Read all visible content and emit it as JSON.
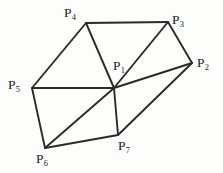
{
  "figure": {
    "kind": "planar-triangulated-point-mesh",
    "width": 223,
    "height": 173,
    "background_color": "#fdfdfc",
    "edge_color": "#2b2b2b",
    "edge_width": 1.9,
    "label_color": "#1c1c1c"
  },
  "vertices": [
    {
      "id": "P1",
      "base": "P",
      "index": "1",
      "x": 114,
      "y": 88,
      "label_x": 113,
      "label_y": 59
    },
    {
      "id": "P2",
      "base": "P",
      "index": "2",
      "x": 192,
      "y": 63,
      "label_x": 197,
      "label_y": 56
    },
    {
      "id": "P3",
      "base": "P",
      "index": "3",
      "x": 168,
      "y": 22,
      "label_x": 172,
      "label_y": 13
    },
    {
      "id": "P4",
      "base": "P",
      "index": "4",
      "x": 86,
      "y": 23,
      "label_x": 64,
      "label_y": 6
    },
    {
      "id": "P5",
      "base": "P",
      "index": "5",
      "x": 32,
      "y": 88,
      "label_x": 8,
      "label_y": 78
    },
    {
      "id": "P6",
      "base": "P",
      "index": "6",
      "x": 45,
      "y": 148,
      "label_x": 36,
      "label_y": 152
    },
    {
      "id": "P7",
      "base": "P",
      "index": "7",
      "x": 118,
      "y": 135,
      "label_x": 118,
      "label_y": 139
    }
  ],
  "edges": [
    {
      "from": "P4",
      "to": "P3",
      "x1": 86,
      "y1": 23,
      "x2": 168,
      "y2": 22
    },
    {
      "from": "P4",
      "to": "P5",
      "x1": 86,
      "y1": 23,
      "x2": 32,
      "y2": 88
    },
    {
      "from": "P4",
      "to": "P1",
      "x1": 86,
      "y1": 23,
      "x2": 114,
      "y2": 88
    },
    {
      "from": "P3",
      "to": "P1",
      "x1": 168,
      "y1": 22,
      "x2": 114,
      "y2": 88
    },
    {
      "from": "P3",
      "to": "P2",
      "x1": 168,
      "y1": 22,
      "x2": 192,
      "y2": 63
    },
    {
      "from": "P1",
      "to": "P2",
      "x1": 114,
      "y1": 88,
      "x2": 192,
      "y2": 63
    },
    {
      "from": "P1",
      "to": "P5",
      "x1": 114,
      "y1": 88,
      "x2": 32,
      "y2": 88
    },
    {
      "from": "P1",
      "to": "P7",
      "x1": 114,
      "y1": 88,
      "x2": 118,
      "y2": 135
    },
    {
      "from": "P1",
      "to": "P6",
      "x1": 114,
      "y1": 88,
      "x2": 45,
      "y2": 148
    },
    {
      "from": "P5",
      "to": "P6",
      "x1": 32,
      "y1": 88,
      "x2": 45,
      "y2": 148
    },
    {
      "from": "P6",
      "to": "P7",
      "x1": 45,
      "y1": 148,
      "x2": 118,
      "y2": 135
    },
    {
      "from": "P7",
      "to": "P2",
      "x1": 118,
      "y1": 135,
      "x2": 192,
      "y2": 63
    }
  ]
}
